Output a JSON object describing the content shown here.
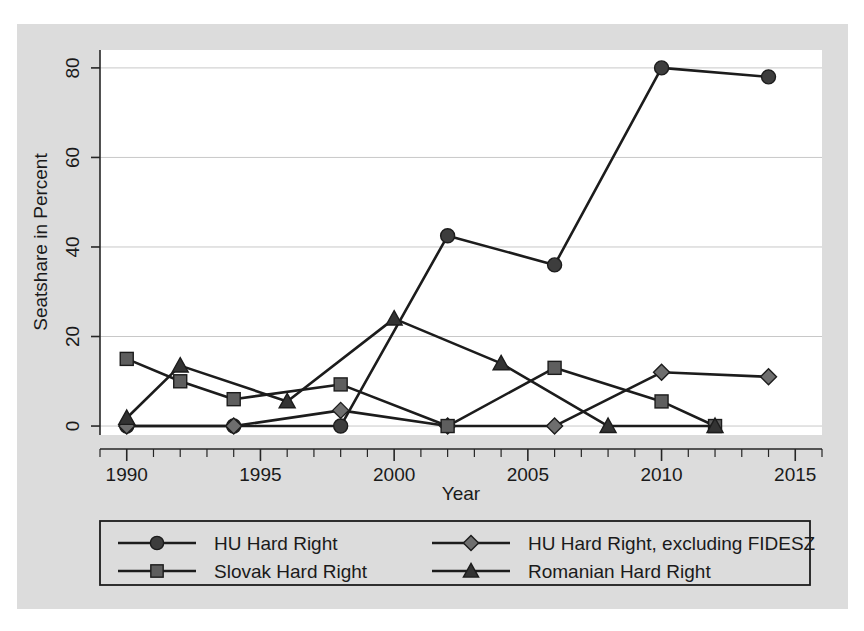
{
  "chart_data": {
    "type": "line",
    "title": "",
    "xlabel": "Year",
    "ylabel": "Seatshare in Percent",
    "xlim": [
      1989,
      2016
    ],
    "ylim": [
      -2,
      84
    ],
    "xticks": [
      1990,
      1995,
      2000,
      2005,
      2010,
      2015
    ],
    "xtick_labels": [
      "1990",
      "1995",
      "2000",
      "2005",
      "2010",
      "2015"
    ],
    "xminor_step": 1,
    "yticks": [
      0,
      20,
      40,
      60,
      80
    ],
    "ytick_labels": [
      "0",
      "20",
      "40",
      "60",
      "80"
    ],
    "grid": "horizontal",
    "legend_position": "below",
    "series": [
      {
        "name": "HU Hard Right",
        "marker": "circle",
        "marker_color": "#3d3d3d",
        "line_color": "#1c1c1c",
        "x": [
          1990,
          1994,
          1998,
          2002,
          2006,
          2010,
          2014
        ],
        "y": [
          0,
          0,
          0,
          42.5,
          36,
          80,
          78
        ]
      },
      {
        "name": "HU Hard Right, excluding FIDESZ",
        "marker": "diamond",
        "marker_color": "#6e6e6e",
        "line_color": "#1c1c1c",
        "x": [
          1990,
          1994,
          1998,
          2002,
          2006,
          2010,
          2014
        ],
        "y": [
          0,
          0,
          3.5,
          0,
          0,
          12,
          11
        ]
      },
      {
        "name": "Slovak Hard Right",
        "marker": "square",
        "marker_color": "#5e5e5e",
        "line_color": "#1c1c1c",
        "x": [
          1990,
          1992,
          1994,
          1998,
          2002,
          2006,
          2010,
          2012
        ],
        "y": [
          15,
          10,
          6,
          9.3,
          0,
          13,
          5.5,
          0
        ]
      },
      {
        "name": "Romanian Hard Right",
        "marker": "triangle",
        "marker_color": "#333333",
        "line_color": "#1c1c1c",
        "x": [
          1990,
          1992,
          1996,
          2000,
          2004,
          2008,
          2012
        ],
        "y": [
          1.8,
          13.5,
          5.5,
          24,
          14,
          0,
          0
        ]
      }
    ]
  },
  "legend": {
    "entries": [
      {
        "label": "HU Hard Right",
        "marker": "circle"
      },
      {
        "label": "HU Hard Right, excluding FIDESZ",
        "marker": "diamond"
      },
      {
        "label": "Slovak Hard Right",
        "marker": "square"
      },
      {
        "label": "Romanian Hard Right",
        "marker": "triangle"
      }
    ]
  },
  "colors": {
    "figure_background": "#dcdcdc",
    "plot_background": "#ffffff",
    "axis": "#262626",
    "gridline": "#c8c8c8",
    "line": "#1c1c1c"
  }
}
